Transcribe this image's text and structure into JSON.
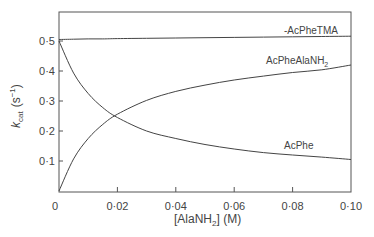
{
  "chart_data": {
    "type": "line",
    "title": "",
    "xlabel": "[AlaNH2] (M)",
    "ylabel": "k_cat (s^-1)",
    "xlim": [
      0,
      0.1
    ],
    "ylim": [
      0,
      0.6
    ],
    "grid": false,
    "legend": "inline labels",
    "x_ticks": [
      "0",
      "0·02",
      "0·04",
      "0·06",
      "0·08",
      "0·10"
    ],
    "y_ticks": [
      "0",
      "0·1",
      "0·2",
      "0·3",
      "0·4",
      "0·5"
    ],
    "x": [
      0,
      0.005,
      0.01,
      0.015,
      0.02,
      0.03,
      0.04,
      0.05,
      0.06,
      0.07,
      0.08,
      0.09,
      0.1
    ],
    "series": [
      {
        "name": "AcPheTMA",
        "values": [
          0.505,
          0.506,
          0.507,
          0.507,
          0.508,
          0.509,
          0.51,
          0.511,
          0.512,
          0.513,
          0.514,
          0.515,
          0.516
        ]
      },
      {
        "name": "AcPheAlaNH2",
        "values": [
          0.0,
          0.107,
          0.175,
          0.222,
          0.256,
          0.302,
          0.332,
          0.353,
          0.37,
          0.383,
          0.395,
          0.404,
          0.42
        ]
      },
      {
        "name": "AcPhe",
        "values": [
          0.5,
          0.393,
          0.325,
          0.278,
          0.245,
          0.2,
          0.175,
          0.155,
          0.14,
          0.128,
          0.12,
          0.113,
          0.105
        ]
      }
    ]
  },
  "labels": {
    "y_axis_k": "k",
    "y_axis_sub": "cat",
    "y_axis_unit": "(s",
    "y_axis_sup": "−1",
    "y_axis_close": ")",
    "x_axis_main": "[AlaNH",
    "x_axis_sub": "2",
    "x_axis_rest": "] (M)",
    "series_tma": "-AcPheTMA",
    "series_alanh2_main": "AcPheAlaNH",
    "series_alanh2_sub": "2",
    "series_acphe": "AcPhe"
  }
}
